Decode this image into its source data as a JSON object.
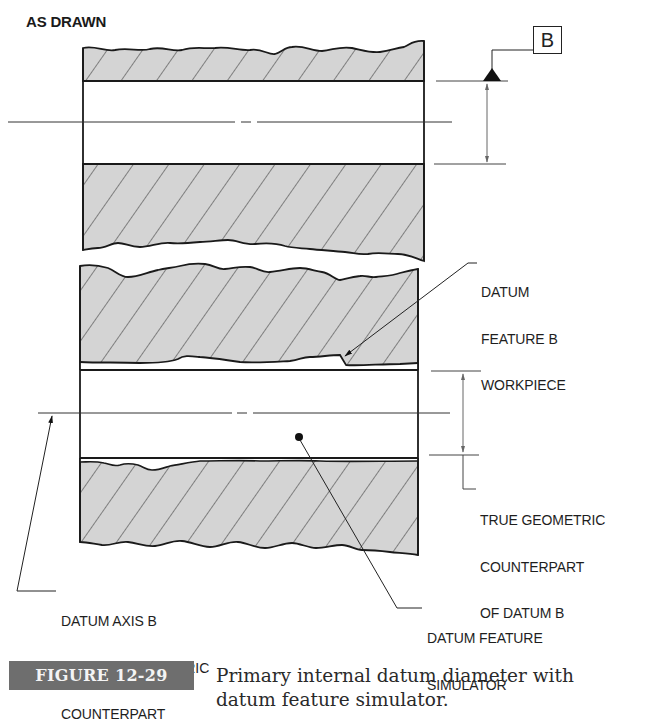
{
  "figure": {
    "label": "FIGURE 12-29",
    "caption_lines": [
      "Primary internal datum diameter with",
      "datum feature simulator."
    ],
    "badge_color": "#6e6e6e"
  },
  "as_drawn": {
    "title": "AS DRAWN",
    "datum_letter": "B"
  },
  "callouts": {
    "workpiece": [
      "DATUM",
      "FEATURE B",
      "WORKPIECE"
    ],
    "true_counterpart": [
      "TRUE GEOMETRIC",
      "COUNTERPART",
      "OF DATUM B"
    ],
    "datum_axis": [
      "DATUM AXIS B",
      "OF TRUE GEOMETRIC",
      "COUNTERPART"
    ],
    "simulator": [
      "DATUM FEATURE",
      "SIMULATOR"
    ]
  },
  "colors": {
    "section_fill": "#d4d4d4",
    "line": "#1a1a1a",
    "dim_line": "#555555"
  }
}
